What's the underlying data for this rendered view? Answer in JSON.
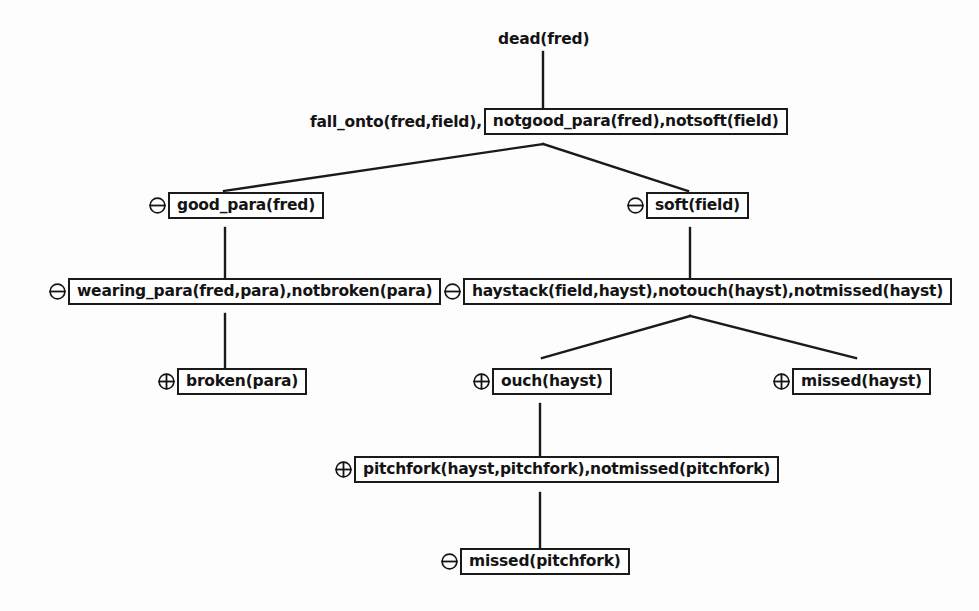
{
  "diagram": {
    "title": "dead(fred)",
    "type": "proof-tree",
    "colors": {
      "ink": "#141414",
      "background": "#fdfdfd",
      "box_border": "#1a1a1a"
    },
    "signs": {
      "minus": "circled-minus",
      "plus": "circled-plus"
    },
    "nodes": [
      {
        "id": "root",
        "sign": "",
        "prefix": "",
        "label": "dead(fred)",
        "boxed": false,
        "x": 498,
        "y": 30
      },
      {
        "id": "goal",
        "sign": "",
        "prefix": "fall_onto(fred,field),",
        "label": "notgood_para(fred),notsoft(field)",
        "boxed": true,
        "x": 310,
        "y": 108
      },
      {
        "id": "good_para",
        "sign": "minus",
        "prefix": "",
        "label": "good_para(fred)",
        "boxed": true,
        "x": 148,
        "y": 192
      },
      {
        "id": "soft_field",
        "sign": "minus",
        "prefix": "",
        "label": "soft(field)",
        "boxed": true,
        "x": 626,
        "y": 192
      },
      {
        "id": "wearing_para",
        "sign": "minus",
        "prefix": "",
        "label": "wearing_para(fred,para),notbroken(para)",
        "boxed": true,
        "x": 48,
        "y": 278
      },
      {
        "id": "haystack",
        "sign": "minus",
        "prefix": "",
        "label": "haystack(field,hayst),notouch(hayst),notmissed(hayst)",
        "boxed": true,
        "x": 443,
        "y": 278
      },
      {
        "id": "broken_para",
        "sign": "plus",
        "prefix": "",
        "label": "broken(para)",
        "boxed": true,
        "x": 157,
        "y": 368
      },
      {
        "id": "ouch_hayst",
        "sign": "plus",
        "prefix": "",
        "label": "ouch(hayst)",
        "boxed": true,
        "x": 472,
        "y": 368
      },
      {
        "id": "missed_hayst",
        "sign": "plus",
        "prefix": "",
        "label": "missed(hayst)",
        "boxed": true,
        "x": 772,
        "y": 368
      },
      {
        "id": "pitchfork",
        "sign": "plus",
        "prefix": "",
        "label": "pitchfork(hayst,pitchfork),notmissed(pitchfork)",
        "boxed": true,
        "x": 334,
        "y": 456
      },
      {
        "id": "missed_pitchfork",
        "sign": "minus",
        "prefix": "",
        "label": "missed(pitchfork)",
        "boxed": true,
        "x": 440,
        "y": 548
      }
    ],
    "edges": [
      {
        "from": "root",
        "to": "goal",
        "points": "543,52 543,108"
      },
      {
        "from": "goal",
        "to": "good_para",
        "points": "543,144 224,191"
      },
      {
        "from": "goal",
        "to": "soft_field",
        "points": "543,144 688,191"
      },
      {
        "from": "good_para",
        "to": "wearing_para",
        "points": "225,228 225,278"
      },
      {
        "from": "soft_field",
        "to": "haystack",
        "points": "690,228 690,278"
      },
      {
        "from": "wearing_para",
        "to": "broken_para",
        "points": "225,314 225,368"
      },
      {
        "from": "haystack",
        "to": "ouch_hayst",
        "points": "690,316 542,358"
      },
      {
        "from": "haystack",
        "to": "missed_hayst",
        "points": "690,316 856,358"
      },
      {
        "from": "ouch_hayst",
        "to": "pitchfork",
        "points": "540,404 540,456"
      },
      {
        "from": "pitchfork",
        "to": "missed_pitchfork",
        "points": "540,493 540,548"
      }
    ]
  }
}
